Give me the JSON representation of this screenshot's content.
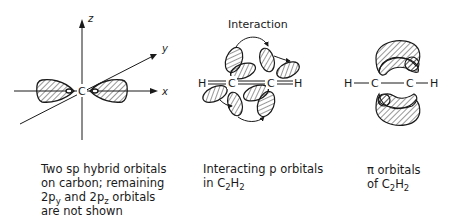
{
  "panels": [
    {
      "id": "sp-hybrid",
      "axes": {
        "z": "z",
        "y": "y",
        "x": "x"
      },
      "atom_label": "C",
      "caption_lines": [
        {
          "text": "Two sp hybrid orbitals"
        },
        {
          "text": "on carbon; remaining"
        },
        {
          "pre": "2p",
          "sub1": "y",
          "mid": " and 2p",
          "sub2": "z",
          "post": " orbitals"
        },
        {
          "text": "are not shown"
        }
      ]
    },
    {
      "id": "interaction",
      "title": "Interaction",
      "atoms": [
        "H",
        "C",
        "C",
        "H"
      ],
      "caption_lines": [
        {
          "text": "Interacting p orbitals"
        },
        {
          "pre": "in C",
          "sub1": "2",
          "mid": "H",
          "sub2": "2",
          "post": ""
        }
      ]
    },
    {
      "id": "pi-orbitals",
      "atoms": [
        "H",
        "C",
        "C",
        "H"
      ],
      "caption_lines": [
        {
          "text": "π orbitals"
        },
        {
          "pre": "of C",
          "sub1": "2",
          "mid": "H",
          "sub2": "2",
          "post": ""
        }
      ]
    }
  ],
  "colors": {
    "ink": "#1a1a1a",
    "background": "#ffffff"
  }
}
